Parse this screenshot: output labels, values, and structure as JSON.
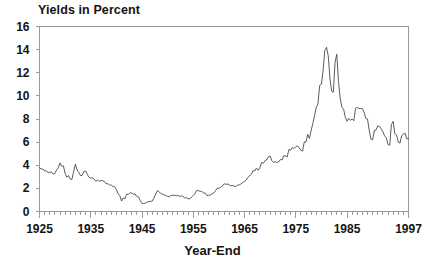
{
  "chart_data": {
    "type": "line",
    "title": "Yields in Percent",
    "xlabel": "Year-End",
    "ylabel": "",
    "xlim": [
      1925,
      1997
    ],
    "ylim": [
      0,
      16
    ],
    "grid": false,
    "legend": null,
    "ytick_labels": [
      "0",
      "2",
      "4",
      "6",
      "8",
      "10",
      "12",
      "14",
      "16"
    ],
    "ytick_values": [
      0,
      2,
      4,
      6,
      8,
      10,
      12,
      14,
      16
    ],
    "xtick_labels": [
      "1925",
      "1935",
      "1945",
      "1955",
      "1965",
      "1975",
      "1985",
      "1997"
    ],
    "xtick_values": [
      1925,
      1935,
      1945,
      1955,
      1965,
      1975,
      1985,
      1997
    ],
    "minor_xtick_interval": 1,
    "line_color": "#4a4a4a",
    "axis_color": "#9a9a9a",
    "background_color": "#ffffff",
    "x": [
      1925,
      1926,
      1927,
      1928,
      1929,
      1930,
      1931,
      1932,
      1933,
      1934,
      1935,
      1936,
      1937,
      1938,
      1939,
      1940,
      1941,
      1942,
      1943,
      1944,
      1945,
      1946,
      1947,
      1948,
      1949,
      1950,
      1951,
      1952,
      1953,
      1954,
      1955,
      1956,
      1957,
      1958,
      1959,
      1960,
      1961,
      1962,
      1963,
      1964,
      1965,
      1966,
      1967,
      1968,
      1969,
      1970,
      1971,
      1972,
      1973,
      1974,
      1975,
      1976,
      1977,
      1978,
      1979,
      1980,
      1981,
      1982,
      1983,
      1984,
      1985,
      1986,
      1987,
      1988,
      1989,
      1990,
      1991,
      1992,
      1993,
      1994,
      1995,
      1996,
      1997
    ],
    "values": [
      3.8,
      3.5,
      3.2,
      3.4,
      4.2,
      3.3,
      4.1,
      3.1,
      3.4,
      3.1,
      2.8,
      2.7,
      2.9,
      2.6,
      2.3,
      2.0,
      1.9,
      2.5,
      2.5,
      2.4,
      1.7,
      1.0,
      0.8,
      0.7,
      1.0,
      1.5,
      1.6,
      1.8,
      1.4,
      1.3,
      1.4,
      1.5,
      1.7,
      1.9,
      1.4,
      1.4,
      1.6,
      1.9,
      2.2,
      2.4,
      2.5,
      3.0,
      2.6,
      3.4,
      3.6,
      3.0,
      4.1,
      3.6,
      4.0,
      3.9,
      4.3,
      4.4,
      4.2,
      5.0,
      4.6,
      4.0,
      4.7,
      5.5,
      4.8,
      4.3,
      4.9,
      6.2,
      5.5,
      5.4,
      6.5,
      7.8,
      6.3,
      7.3,
      8.6,
      7.5,
      8.2,
      7.9,
      8.3
    ],
    "notes_series_actual": [
      3.8,
      3.5,
      3.2,
      3.4,
      4.2,
      3.3,
      4.1,
      3.1,
      3.4,
      3.1,
      2.8,
      2.7,
      2.9,
      2.6,
      2.3,
      2.0,
      1.9
    ],
    "series_line": [
      {
        "year": 1925,
        "value": 3.8
      },
      {
        "year": 1926,
        "value": 3.5
      },
      {
        "year": 1927,
        "value": 3.4
      },
      {
        "year": 1928,
        "value": 3.3
      },
      {
        "year": 1929,
        "value": 4.2
      },
      {
        "year": 1930,
        "value": 3.3
      },
      {
        "year": 1931,
        "value": 2.8
      },
      {
        "year": 1932,
        "value": 4.1
      },
      {
        "year": 1933,
        "value": 3.1
      },
      {
        "year": 1934,
        "value": 3.5
      },
      {
        "year": 1935,
        "value": 2.9
      },
      {
        "year": 1936,
        "value": 2.6
      },
      {
        "year": 1937,
        "value": 2.7
      },
      {
        "year": 1938,
        "value": 2.4
      },
      {
        "year": 1939,
        "value": 2.3
      },
      {
        "year": 1940,
        "value": 1.9
      },
      {
        "year": 1941,
        "value": 0.9
      },
      {
        "year": 1942,
        "value": 1.5
      },
      {
        "year": 1943,
        "value": 1.6
      },
      {
        "year": 1944,
        "value": 1.3
      },
      {
        "year": 1945,
        "value": 0.7
      },
      {
        "year": 1946,
        "value": 0.8
      },
      {
        "year": 1947,
        "value": 0.9
      },
      {
        "year": 1948,
        "value": 1.8
      },
      {
        "year": 1949,
        "value": 1.5
      },
      {
        "year": 1950,
        "value": 1.3
      },
      {
        "year": 1951,
        "value": 1.4
      },
      {
        "year": 1952,
        "value": 1.4
      },
      {
        "year": 1953,
        "value": 1.3
      },
      {
        "year": 1954,
        "value": 1.1
      },
      {
        "year": 1955,
        "value": 1.4
      },
      {
        "year": 1956,
        "value": 1.8
      },
      {
        "year": 1957,
        "value": 1.6
      },
      {
        "year": 1958,
        "value": 1.4
      },
      {
        "year": 1959,
        "value": 1.6
      },
      {
        "year": 1960,
        "value": 2.0
      },
      {
        "year": 1961,
        "value": 2.4
      },
      {
        "year": 1962,
        "value": 2.3
      },
      {
        "year": 1963,
        "value": 2.2
      },
      {
        "year": 1964,
        "value": 2.3
      },
      {
        "year": 1965,
        "value": 2.6
      },
      {
        "year": 1966,
        "value": 3.1
      },
      {
        "year": 1967,
        "value": 3.5
      },
      {
        "year": 1968,
        "value": 3.8
      },
      {
        "year": 1969,
        "value": 4.4
      },
      {
        "year": 1970,
        "value": 4.8
      },
      {
        "year": 1971,
        "value": 4.3
      },
      {
        "year": 1972,
        "value": 4.5
      },
      {
        "year": 1973,
        "value": 4.8
      },
      {
        "year": 1974,
        "value": 5.3
      },
      {
        "year": 1975,
        "value": 5.6
      },
      {
        "year": 1976,
        "value": 5.3
      },
      {
        "year": 1977,
        "value": 6.0
      },
      {
        "year": 1978,
        "value": 7.0
      },
      {
        "year": 1979,
        "value": 9.0
      },
      {
        "year": 1980,
        "value": 11.0
      },
      {
        "year": 1981,
        "value": 14.2
      },
      {
        "year": 1982,
        "value": 10.4
      },
      {
        "year": 1983,
        "value": 13.6
      },
      {
        "year": 1984,
        "value": 9.0
      },
      {
        "year": 1985,
        "value": 7.8
      },
      {
        "year": 1986,
        "value": 8.0
      },
      {
        "year": 1987,
        "value": 9.0
      },
      {
        "year": 1988,
        "value": 8.9
      },
      {
        "year": 1989,
        "value": 8.0
      },
      {
        "year": 1990,
        "value": 6.2
      },
      {
        "year": 1991,
        "value": 7.4
      },
      {
        "year": 1992,
        "value": 6.9
      },
      {
        "year": 1993,
        "value": 5.8
      },
      {
        "year": 1994,
        "value": 7.8
      },
      {
        "year": 1995,
        "value": 6.0
      },
      {
        "year": 1996,
        "value": 6.7
      },
      {
        "year": 1997,
        "value": 6.3
      }
    ]
  }
}
